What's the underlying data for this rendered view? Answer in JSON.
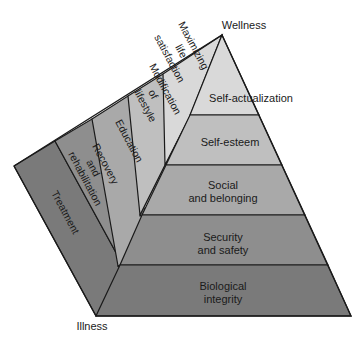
{
  "diagram": {
    "top_label": "Wellness",
    "bottom_label": "Illness",
    "front_levels": [
      {
        "lines": [
          "Self-actualization"
        ]
      },
      {
        "lines": [
          "Self-esteem"
        ]
      },
      {
        "lines": [
          "Social",
          "and belonging"
        ]
      },
      {
        "lines": [
          "Security",
          "and safety"
        ]
      },
      {
        "lines": [
          "Biological",
          "integrity"
        ]
      }
    ],
    "side_levels": [
      {
        "lines": [
          "Maximizing",
          "life",
          "satisfaction"
        ]
      },
      {
        "lines": [
          "Modification",
          "of",
          "lifestyle"
        ]
      },
      {
        "lines": [
          "Education"
        ]
      },
      {
        "lines": [
          "Recovery",
          "and",
          "rehabilitation"
        ]
      },
      {
        "lines": [
          "Treatment"
        ]
      }
    ],
    "colors": {
      "level1": "#d9d9d9",
      "level2": "#bfbfbf",
      "level3": "#a9a9a9",
      "level4": "#8e8e8e",
      "level5": "#7a7a7a",
      "outline": "#1a1a1a"
    }
  }
}
